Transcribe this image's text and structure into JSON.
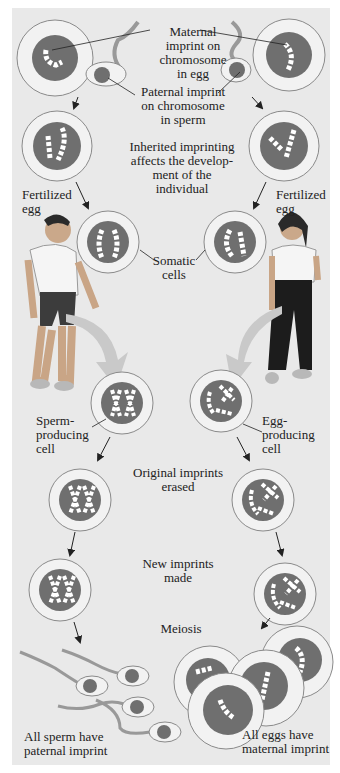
{
  "figure": {
    "labels": {
      "maternal_imprint": "Maternal\nimprint on\nchromosome\nin egg",
      "paternal_imprint": "Paternal imprint\non chromosome\nin sperm",
      "inherited": "Inherited imprinting\naffects the develop-\nment of the\nindividual",
      "fertilized_left": "Fertilized\negg",
      "fertilized_right": "Fertilized\negg",
      "somatic": "Somatic\ncells",
      "sperm_producing": "Sperm-\nproducing\ncell",
      "egg_producing": "Egg-\nproducing\ncell",
      "original_erased": "Original imprints\nerased",
      "new_imprints": "New imprints\nmade",
      "meiosis": "Meiosis",
      "all_sperm": "All sperm have\npaternal imprint",
      "all_eggs": "All eggs have\nmaternal imprint"
    },
    "colors": {
      "background": "#e9e9e9",
      "nucleus": "#6f6f6f",
      "cell": "#f2f2f2",
      "cell_border": "#8a8a8a",
      "arrow": "#c9c9c9"
    }
  }
}
